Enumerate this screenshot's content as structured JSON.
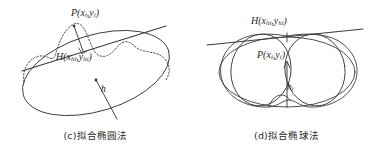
{
  "figure": {
    "width": 382,
    "height": 155,
    "background_color": "#ffffff",
    "stroke_color": "#3a3a3a",
    "text_color": "#1f1f1f"
  },
  "panels": [
    {
      "id": "c",
      "caption": "(c)拟合椭圆法",
      "labels": {
        "point_P": "P(x",
        "point_P_sub1": "i",
        "point_P_mid": ",y",
        "point_P_sub2": "i",
        "point_P_end": ")",
        "point_H": "H(x",
        "point_H_sub1": "hi",
        "point_H_mid": ",y",
        "point_H_sub2": "hi",
        "point_H_end": ")",
        "height_h": "h"
      }
    },
    {
      "id": "d",
      "caption": "(d)拟合椭球法",
      "labels": {
        "point_H": "H(x",
        "point_H_sub1": "hi",
        "point_H_mid": ",y",
        "point_H_sub2": "hi",
        "point_H_end": ")",
        "point_P": "P(x",
        "point_P_sub1": "i",
        "point_P_mid": ",y",
        "point_P_sub2": "i",
        "point_P_end": ")",
        "height_h": "h",
        "height_h_sub": "i"
      }
    }
  ]
}
